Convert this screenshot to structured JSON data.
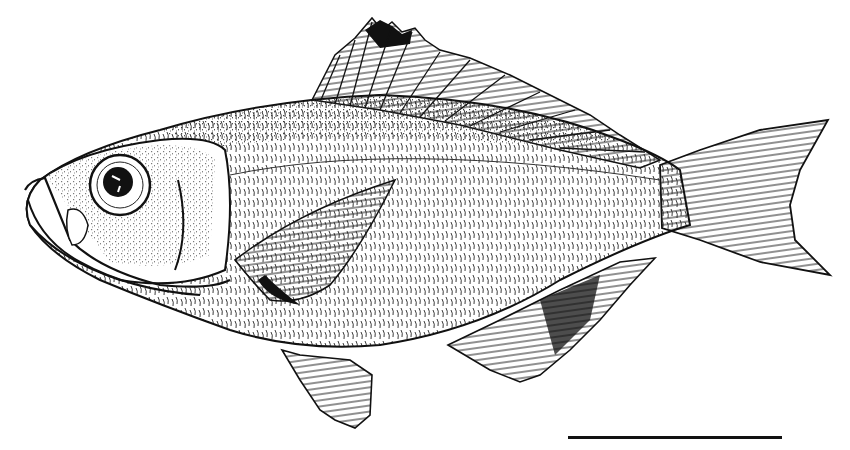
{
  "figure": {
    "style": "black ink line drawing on white",
    "ink_color": "#111111",
    "background_color": "#ffffff",
    "fins": [
      "dorsal-fin",
      "caudal-fin",
      "anal-fin",
      "pelvic-fin",
      "pectoral-fin"
    ],
    "scale_bar": {
      "label": ""
    }
  }
}
